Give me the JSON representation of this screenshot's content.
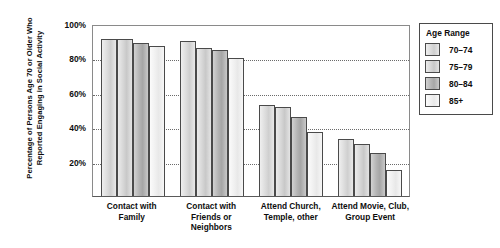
{
  "chart_data": {
    "type": "bar",
    "title": "",
    "subtitle": "",
    "xlabel": "",
    "ylabel": "Percentage of Persons Age 70 or Older Who Reported Engaging in Social Activity",
    "ylim": [
      0,
      100
    ],
    "y_ticks": [
      "20%",
      "40%",
      "60%",
      "80%",
      "100%"
    ],
    "y_tick_values": [
      20,
      40,
      60,
      80,
      100
    ],
    "grid": "horizontal-dotted",
    "legend_position": "right",
    "legend_title": "Age Range",
    "categories": [
      "Contact with Family",
      "Contact with Friends or Neighbors",
      "Attend Church, Temple, other",
      "Attend Movie, Club, Group Event"
    ],
    "series": [
      {
        "name": "70–74",
        "values": [
          91,
          90,
          53,
          33
        ]
      },
      {
        "name": "75–79",
        "values": [
          91,
          86,
          52,
          30
        ]
      },
      {
        "name": "80–84",
        "values": [
          89,
          85,
          46,
          25
        ]
      },
      {
        "name": "85+",
        "values": [
          87,
          80,
          37,
          15
        ]
      }
    ]
  },
  "legend": {
    "title": "Age Range",
    "items": [
      {
        "label": "70–74"
      },
      {
        "label": "75–79"
      },
      {
        "label": "80–84"
      },
      {
        "label": "85+"
      }
    ]
  },
  "axes": {
    "y_title": "Percentage of Persons Age 70 or Older Who Reported Engaging in Social Activity",
    "y_ticks": [
      "100%",
      "80%",
      "60%",
      "40%",
      "20%"
    ]
  },
  "x_categories": [
    "Contact with Family",
    "Contact with Friends or Neighbors",
    "Attend Church, Temple, other",
    "Attend Movie, Club, Group Event"
  ]
}
